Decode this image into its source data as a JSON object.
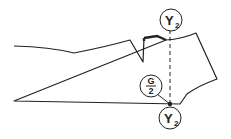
{
  "diagram": {
    "type": "pattern-draft",
    "labels": {
      "top_marker": {
        "main": "Y",
        "sub": "2"
      },
      "mid_marker": {
        "numerator": "G",
        "denominator": "2"
      },
      "bottom_marker": {
        "main": "Y",
        "sub": "2"
      }
    },
    "colors": {
      "line": "#222222",
      "background": "#ffffff"
    }
  }
}
